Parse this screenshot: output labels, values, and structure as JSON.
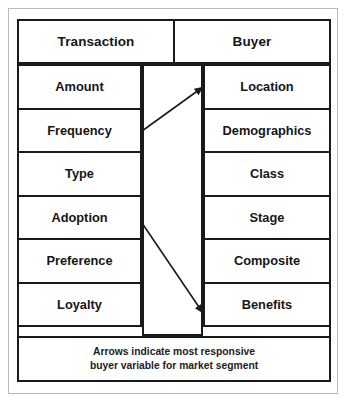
{
  "figure": {
    "border_color": "#1a1a1a",
    "outer_frame_color": "#b9b9b9",
    "background_color": "#ffffff",
    "text_color": "#161616"
  },
  "header": {
    "left_label": "Transaction",
    "right_label": "Buyer"
  },
  "rows": [
    {
      "left": "Amount",
      "right": "Location"
    },
    {
      "left": "Frequency",
      "right": "Demographics"
    },
    {
      "left": "Type",
      "right": "Class"
    },
    {
      "left": "Adoption",
      "right": "Stage"
    },
    {
      "left": "Preference",
      "right": "Composite"
    },
    {
      "left": "Loyalty",
      "right": "Benefits"
    }
  ],
  "arrows": [
    {
      "name": "frequency-to-location-arrow",
      "from_label": "Frequency",
      "to_label": "Location",
      "direction": "up-right",
      "color": "#1a1a1a"
    },
    {
      "name": "adoption-to-benefits-arrow",
      "from_label": "Adoption",
      "to_label": "Benefits",
      "direction": "down-right",
      "color": "#1a1a1a"
    }
  ],
  "footer": {
    "line1": "Arrows indicate most responsive",
    "line2": "buyer variable for market segment"
  }
}
